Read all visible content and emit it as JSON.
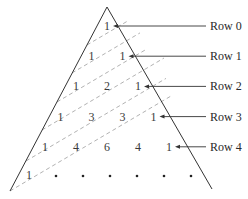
{
  "diagram": {
    "rows": [
      {
        "label": "Row 0",
        "values": [
          "1"
        ]
      },
      {
        "label": "Row 1",
        "values": [
          "1",
          "1"
        ]
      },
      {
        "label": "Row 2",
        "values": [
          "1",
          "2",
          "1"
        ]
      },
      {
        "label": "Row 3",
        "values": [
          "1",
          "3",
          "3",
          "1"
        ]
      },
      {
        "label": "Row 4",
        "values": [
          "1",
          "4",
          "6",
          "4",
          "1"
        ]
      }
    ],
    "continuation_row": {
      "first_value": "1",
      "ellipsis_dots": 6
    },
    "diagonal_lines": 6,
    "colors": {
      "edge": "#333333",
      "diagonal": "#a8a8a8",
      "text": "#3a3a3a"
    }
  }
}
